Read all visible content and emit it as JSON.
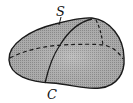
{
  "diagram": {
    "type": "closed-surface-with-curve",
    "labels": {
      "surface": "S",
      "curve": "C"
    },
    "colors": {
      "stroke": "#1a1a1a",
      "fill": "#a8a8a8",
      "fill_light": "#c4c4c4",
      "background": "#ffffff"
    }
  }
}
